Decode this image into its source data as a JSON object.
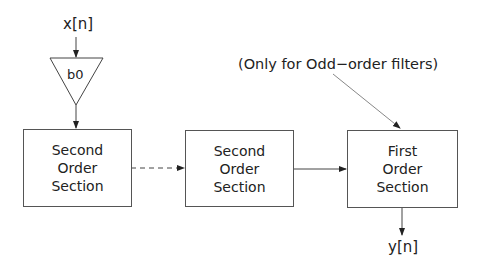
{
  "diagram": {
    "input_label": "x[n]",
    "gain_label": "b0",
    "output_label": "y[n]",
    "annotation": "(Only for Odd−order filters)",
    "blocks": [
      {
        "lines": [
          "Second",
          "Order",
          "Section"
        ]
      },
      {
        "lines": [
          "Second",
          "Order",
          "Section"
        ]
      },
      {
        "lines": [
          "First",
          "Order",
          "Section"
        ]
      }
    ],
    "connections": [
      {
        "from": "input",
        "to": "gain",
        "style": "solid"
      },
      {
        "from": "gain",
        "to": "block-0",
        "style": "solid"
      },
      {
        "from": "block-0",
        "to": "block-1",
        "style": "dashed"
      },
      {
        "from": "block-1",
        "to": "block-2",
        "style": "solid"
      },
      {
        "from": "block-2",
        "to": "output",
        "style": "solid"
      },
      {
        "from": "annotation",
        "to": "block-2",
        "style": "solid"
      }
    ],
    "colors": {
      "line": "#444444",
      "text": "#222222",
      "background": "#ffffff"
    }
  }
}
